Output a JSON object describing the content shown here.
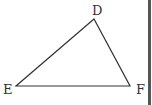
{
  "diagram": {
    "type": "triangle",
    "stroke_color": "#333333",
    "vertices": [
      {
        "label": "D",
        "x": 94,
        "y": 19,
        "label_x": 92,
        "label_y": 15
      },
      {
        "label": "E",
        "x": 16,
        "y": 86,
        "label_x": 3,
        "label_y": 94
      },
      {
        "label": "F",
        "x": 130,
        "y": 86,
        "label_x": 136,
        "label_y": 94
      }
    ],
    "edges": [
      [
        "D",
        "E"
      ],
      [
        "E",
        "F"
      ],
      [
        "F",
        "D"
      ]
    ]
  }
}
